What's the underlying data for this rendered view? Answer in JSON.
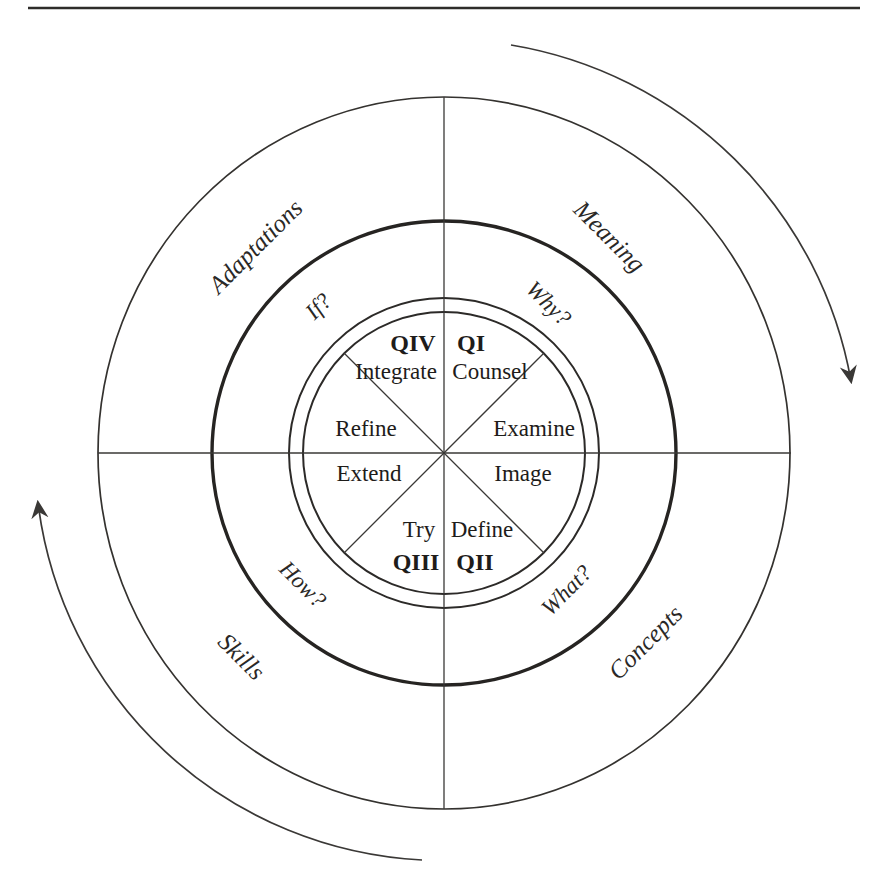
{
  "colors": {
    "background": "#ffffff",
    "line": "#34322f",
    "text": "#1e1c1a"
  },
  "wheel": {
    "outer_ring_labels": [
      {
        "text": "Adaptations",
        "position": "upper-left"
      },
      {
        "text": "Meaning",
        "position": "upper-right"
      },
      {
        "text": "Skills",
        "position": "lower-left"
      },
      {
        "text": "Concepts",
        "position": "lower-right"
      }
    ],
    "question_ring_labels": [
      {
        "text": "If?",
        "position": "upper-left"
      },
      {
        "text": "Why?",
        "position": "upper-right"
      },
      {
        "text": "How?",
        "position": "lower-left"
      },
      {
        "text": "What?",
        "position": "lower-right"
      }
    ],
    "quadrant_codes": [
      {
        "text": "QIV",
        "position": "upper-left"
      },
      {
        "text": "QI",
        "position": "upper-right"
      },
      {
        "text": "QIII",
        "position": "lower-left"
      },
      {
        "text": "QII",
        "position": "lower-right"
      }
    ],
    "sector_words": [
      {
        "text": "Integrate",
        "position": "upper-left-top"
      },
      {
        "text": "Counsel",
        "position": "upper-right-top"
      },
      {
        "text": "Refine",
        "position": "upper-left-side"
      },
      {
        "text": "Examine",
        "position": "upper-right-side"
      },
      {
        "text": "Extend",
        "position": "lower-left-side"
      },
      {
        "text": "Image",
        "position": "lower-right-side"
      },
      {
        "text": "Try",
        "position": "lower-left-bottom"
      },
      {
        "text": "Define",
        "position": "lower-right-bottom"
      }
    ]
  }
}
